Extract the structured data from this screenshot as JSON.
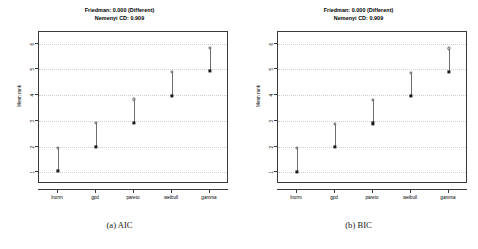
{
  "figure": {
    "panels": [
      {
        "key": "aic",
        "caption": "(a) AIC",
        "title_line1": "Friedman: 0.000 (Different)",
        "title_line2": "Nemenyi CD: 0.909",
        "chart_data": {
          "type": "scatter",
          "title": "Friedman: 0.000 (Different)\nNemenyi CD: 0.909",
          "subtitle": "Nemenyi CD: 0.909",
          "xlabel": "",
          "ylabel": "Mean rank",
          "categories": [
            "lnorm",
            "gpd",
            "pareto",
            "weibull",
            "gamma"
          ],
          "yticks": [
            1,
            2,
            3,
            4,
            5,
            6
          ],
          "ylim": [
            0.55,
            6.45
          ],
          "grid": true,
          "legend": "none",
          "series": [
            {
              "name": "Mean rank",
              "marker": "filled-square",
              "values": [
                1.05,
                2.0,
                2.92,
                3.98,
                4.93
              ]
            },
            {
              "name": "Mean rank + CD",
              "marker": "open-circle",
              "values": [
                1.96,
                2.91,
                3.83,
                4.89,
                5.84
              ]
            }
          ],
          "annotations": {
            "friedman_p": "0.000",
            "friedman_result": "Different",
            "nemenyi_cd": "0.909"
          }
        }
      },
      {
        "key": "bic",
        "caption": "(b) BIC",
        "title_line1": "Friedman: 0.000 (Different)",
        "title_line2": "Nemenyi CD: 0.909",
        "chart_data": {
          "type": "scatter",
          "title": "Friedman: 0.000 (Different)\nNemenyi CD: 0.909",
          "subtitle": "Nemenyi CD: 0.909",
          "xlabel": "",
          "ylabel": "Mean rank",
          "categories": [
            "lnorm",
            "gpd",
            "pareto",
            "weibull",
            "gamma"
          ],
          "yticks": [
            1,
            2,
            3,
            4,
            5,
            6
          ],
          "ylim": [
            0.55,
            6.45
          ],
          "grid": true,
          "legend": "none",
          "series": [
            {
              "name": "Mean rank",
              "marker": "filled-square",
              "values": [
                1.03,
                1.98,
                2.9,
                3.96,
                4.9
              ]
            },
            {
              "name": "Mean rank + CD",
              "marker": "open-circle",
              "values": [
                1.94,
                2.89,
                3.81,
                4.87,
                5.81
              ]
            }
          ],
          "annotations": {
            "friedman_p": "0.000",
            "friedman_result": "Different",
            "nemenyi_cd": "0.909"
          }
        }
      }
    ]
  },
  "colors": {
    "axis": "#3a3a3a",
    "grid": "#cfcfcf",
    "mean_marker": "#1a1a1a",
    "cd_marker": "#5a5a5a",
    "cd_line": "#6d6d6d",
    "background": "#ffffff",
    "text": "#000000"
  }
}
